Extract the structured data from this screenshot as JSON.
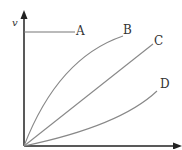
{
  "diagram": {
    "y_axis_label": "v",
    "curves": [
      {
        "label": "A",
        "shape": "horizontal line"
      },
      {
        "label": "B",
        "shape": "concave down curve"
      },
      {
        "label": "C",
        "shape": "straight line through origin"
      },
      {
        "label": "D",
        "shape": "concave up curve"
      }
    ],
    "colors": {
      "axes": "#222222",
      "curves": "#888888",
      "text": "#333333"
    }
  }
}
